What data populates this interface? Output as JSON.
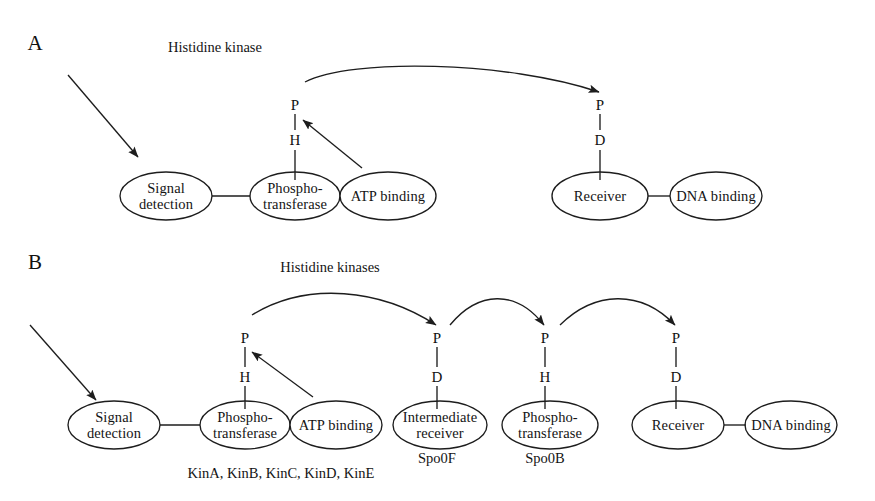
{
  "figure": {
    "background": "#ffffff",
    "stroke_color": "#1d1d1d"
  },
  "panels": [
    {
      "id": "A",
      "letter": "A",
      "letter_x": 35,
      "letter_y": 43,
      "group_title": "Histidine kinase",
      "group_title_x": 215,
      "group_title_y": 47,
      "nodes": [
        {
          "name": "signal-detection",
          "label": "Signal\ndetection",
          "cx": 166,
          "cy": 196,
          "rx": 46,
          "ry": 24
        },
        {
          "name": "phosphotransferase",
          "label": "Phospho-\ntransferase",
          "cx": 295,
          "cy": 196,
          "rx": 45,
          "ry": 24
        },
        {
          "name": "atp-binding",
          "label": "ATP binding",
          "cx": 388,
          "cy": 196,
          "rx": 48,
          "ry": 24
        },
        {
          "name": "receiver",
          "label": "Receiver",
          "cx": 600,
          "cy": 196,
          "rx": 48,
          "ry": 24
        },
        {
          "name": "dna-binding",
          "label": "DNA binding",
          "cx": 716,
          "cy": 196,
          "rx": 46,
          "ry": 24
        }
      ],
      "residue_stacks": [
        {
          "name": "kinase-phospho-histidine",
          "x": 295,
          "top_label": "P",
          "top_y": 105,
          "bottom_label": "H",
          "bottom_y": 140
        },
        {
          "name": "receiver-phospho-aspartate",
          "x": 600,
          "top_label": "P",
          "top_y": 105,
          "bottom_label": "D",
          "bottom_y": 140
        }
      ]
    },
    {
      "id": "B",
      "letter": "B",
      "letter_x": 35,
      "letter_y": 262,
      "group_title": "Histidine kinases",
      "group_title_x": 330,
      "group_title_y": 267,
      "nodes": [
        {
          "name": "signal-detection",
          "label": "Signal\ndetection",
          "cx": 114,
          "cy": 425,
          "rx": 46,
          "ry": 24
        },
        {
          "name": "phosphotransferase",
          "label": "Phospho-\ntransferase",
          "cx": 245,
          "cy": 425,
          "rx": 45,
          "ry": 24
        },
        {
          "name": "atp-binding",
          "label": "ATP binding",
          "cx": 336,
          "cy": 425,
          "rx": 46,
          "ry": 24
        },
        {
          "name": "intermediate-receiver",
          "label": "Intermediate\nreceiver",
          "cx": 440,
          "cy": 425,
          "rx": 47,
          "ry": 24
        },
        {
          "name": "phosphotransferase-spo0b",
          "label": "Phospho-\ntransferase",
          "cx": 550,
          "cy": 425,
          "rx": 48,
          "ry": 24
        },
        {
          "name": "receiver",
          "label": "Receiver",
          "cx": 678,
          "cy": 425,
          "rx": 46,
          "ry": 24
        },
        {
          "name": "dna-binding",
          "label": "DNA binding",
          "cx": 791,
          "cy": 425,
          "rx": 46,
          "ry": 24
        }
      ],
      "residue_stacks": [
        {
          "name": "kinase-phospho-histidine",
          "x": 245,
          "top_label": "P",
          "top_y": 338,
          "bottom_label": "H",
          "bottom_y": 377
        },
        {
          "name": "spo0f-phospho-aspartate",
          "x": 437,
          "top_label": "P",
          "top_y": 338,
          "bottom_label": "D",
          "bottom_y": 377
        },
        {
          "name": "spo0b-phospho-histidine",
          "x": 545,
          "top_label": "P",
          "top_y": 338,
          "bottom_label": "H",
          "bottom_y": 377
        },
        {
          "name": "spo0a-phospho-aspartate",
          "x": 676,
          "top_label": "P",
          "top_y": 338,
          "bottom_label": "D",
          "bottom_y": 377
        }
      ],
      "gene_labels": [
        {
          "name": "kinase-gene-list",
          "text": "KinA, KinB, KinC, KinD, KinE",
          "x": 281,
          "y": 473
        },
        {
          "name": "spo0f-gene",
          "text": "Spo0F",
          "x": 437,
          "y": 458
        },
        {
          "name": "spo0b-gene",
          "text": "Spo0B",
          "x": 545,
          "y": 458
        }
      ]
    }
  ],
  "connectors": {
    "panel_a": {
      "signal_input_arrow": {
        "name": "signal-input-arrow",
        "x1": 68,
        "y1": 75,
        "x2": 138,
        "y2": 157
      },
      "atp-arrow": {
        "name": "atp-transfer-arrow",
        "x1": 362,
        "y1": 168,
        "x2": 303,
        "y2": 120
      },
      "domain_link": {
        "name": "signal-to-kinase-link",
        "x1": 212,
        "y1": 196,
        "x2": 250,
        "y2": 196
      },
      "output_link": {
        "name": "receiver-to-dna-link",
        "x1": 648,
        "y1": 196,
        "x2": 670,
        "y2": 196
      },
      "phosphotransfer_arc": {
        "name": "kinase-to-receiver-arc",
        "x1": 305,
        "y1": 82,
        "x2": 599,
        "y2": 92
      },
      "stem_to_node": [
        {
          "name": "kinase-residue-stem",
          "x": 295,
          "y1": 150,
          "y2": 180
        },
        {
          "name": "receiver-residue-stem",
          "x": 600,
          "y1": 150,
          "y2": 180
        }
      ]
    },
    "panel_b": {
      "signal_input_arrow": {
        "name": "signal-input-arrow",
        "x1": 30,
        "y1": 325,
        "x2": 96,
        "y2": 400
      },
      "atp-arrow": {
        "name": "atp-transfer-arrow",
        "x1": 313,
        "y1": 397,
        "x2": 252,
        "y2": 352
      },
      "domain_link": {
        "name": "signal-to-kinase-link",
        "x1": 160,
        "y1": 425,
        "x2": 200,
        "y2": 425
      },
      "output_link": {
        "name": "receiver-to-dna-link",
        "x1": 724,
        "y1": 425,
        "x2": 746,
        "y2": 425
      },
      "phosphorelay_arcs": [
        {
          "name": "kinase-to-spo0f-arc",
          "x1": 252,
          "y1": 315,
          "x2": 436,
          "y2": 325
        },
        {
          "name": "spo0f-to-spo0b-arc",
          "x1": 450,
          "y1": 325,
          "x2": 544,
          "y2": 325
        },
        {
          "name": "spo0b-to-spo0a-arc",
          "x1": 560,
          "y1": 325,
          "x2": 675,
          "y2": 325
        }
      ],
      "stem_to_node": [
        {
          "name": "kinase-residue-stem",
          "x": 245,
          "y1": 386,
          "y2": 409
        },
        {
          "name": "spo0f-residue-stem",
          "x": 437,
          "y1": 386,
          "y2": 409
        },
        {
          "name": "spo0b-residue-stem",
          "x": 545,
          "y1": 386,
          "y2": 409
        },
        {
          "name": "spo0a-residue-stem",
          "x": 676,
          "y1": 386,
          "y2": 409
        }
      ]
    }
  }
}
